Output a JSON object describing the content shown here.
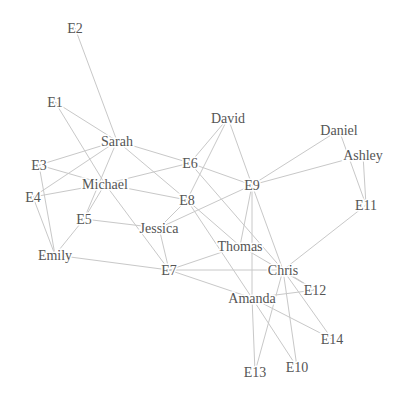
{
  "diagram": {
    "type": "network-graph",
    "background": "#ffffff",
    "edge_color": "#c8c8c8",
    "label_color": "#555555",
    "nodes": [
      {
        "id": "E2",
        "label": "E2",
        "x": 75,
        "y": 28
      },
      {
        "id": "E1",
        "label": "E1",
        "x": 55,
        "y": 102
      },
      {
        "id": "Sarah",
        "label": "Sarah",
        "x": 117,
        "y": 141
      },
      {
        "id": "E3",
        "label": "E3",
        "x": 39,
        "y": 165
      },
      {
        "id": "Michael",
        "label": "Michael",
        "x": 105,
        "y": 184
      },
      {
        "id": "E4",
        "label": "E4",
        "x": 33,
        "y": 197
      },
      {
        "id": "E5",
        "label": "E5",
        "x": 84,
        "y": 219
      },
      {
        "id": "Emily",
        "label": "Emily",
        "x": 55,
        "y": 255
      },
      {
        "id": "Jessica",
        "label": "Jessica",
        "x": 159,
        "y": 228
      },
      {
        "id": "E8",
        "label": "E8",
        "x": 187,
        "y": 200
      },
      {
        "id": "E6",
        "label": "E6",
        "x": 190,
        "y": 163
      },
      {
        "id": "David",
        "label": "David",
        "x": 228,
        "y": 118
      },
      {
        "id": "E9",
        "label": "E9",
        "x": 252,
        "y": 185
      },
      {
        "id": "Daniel",
        "label": "Daniel",
        "x": 339,
        "y": 130
      },
      {
        "id": "Ashley",
        "label": "Ashley",
        "x": 363,
        "y": 155
      },
      {
        "id": "E11",
        "label": "E11",
        "x": 366,
        "y": 205
      },
      {
        "id": "Thomas",
        "label": "Thomas",
        "x": 240,
        "y": 246
      },
      {
        "id": "Chris",
        "label": "Chris",
        "x": 283,
        "y": 270
      },
      {
        "id": "E7",
        "label": "E7",
        "x": 169,
        "y": 270
      },
      {
        "id": "E12",
        "label": "E12",
        "x": 315,
        "y": 290
      },
      {
        "id": "Amanda",
        "label": "Amanda",
        "x": 252,
        "y": 298
      },
      {
        "id": "E14",
        "label": "E14",
        "x": 332,
        "y": 339
      },
      {
        "id": "E13",
        "label": "E13",
        "x": 255,
        "y": 372
      },
      {
        "id": "E10",
        "label": "E10",
        "x": 297,
        "y": 367
      }
    ],
    "edges": [
      [
        "E2",
        "Sarah"
      ],
      [
        "E1",
        "Sarah"
      ],
      [
        "E1",
        "Michael"
      ],
      [
        "Sarah",
        "E3"
      ],
      [
        "Sarah",
        "E4"
      ],
      [
        "Sarah",
        "E5"
      ],
      [
        "Sarah",
        "E6"
      ],
      [
        "Sarah",
        "E8"
      ],
      [
        "E3",
        "Michael"
      ],
      [
        "E3",
        "Emily"
      ],
      [
        "Michael",
        "E4"
      ],
      [
        "Michael",
        "E6"
      ],
      [
        "Michael",
        "E8"
      ],
      [
        "Michael",
        "E5"
      ],
      [
        "Michael",
        "E7"
      ],
      [
        "E4",
        "Emily"
      ],
      [
        "E5",
        "Emily"
      ],
      [
        "E5",
        "Jessica"
      ],
      [
        "Emily",
        "E7"
      ],
      [
        "Jessica",
        "E8"
      ],
      [
        "Jessica",
        "E7"
      ],
      [
        "Jessica",
        "E9"
      ],
      [
        "E8",
        "David"
      ],
      [
        "E8",
        "Thomas"
      ],
      [
        "E8",
        "Amanda"
      ],
      [
        "E6",
        "David"
      ],
      [
        "E6",
        "E9"
      ],
      [
        "E6",
        "Chris"
      ],
      [
        "David",
        "E9"
      ],
      [
        "E9",
        "Daniel"
      ],
      [
        "E9",
        "Ashley"
      ],
      [
        "E9",
        "Thomas"
      ],
      [
        "E9",
        "Chris"
      ],
      [
        "E9",
        "Amanda"
      ],
      [
        "Daniel",
        "E11"
      ],
      [
        "Ashley",
        "E11"
      ],
      [
        "E11",
        "Chris"
      ],
      [
        "Thomas",
        "E7"
      ],
      [
        "Thomas",
        "E12"
      ],
      [
        "E7",
        "Chris"
      ],
      [
        "E7",
        "Amanda"
      ],
      [
        "Chris",
        "E12"
      ],
      [
        "Chris",
        "E14"
      ],
      [
        "Chris",
        "E13"
      ],
      [
        "Chris",
        "E10"
      ],
      [
        "Amanda",
        "E12"
      ],
      [
        "Amanda",
        "E14"
      ],
      [
        "Amanda",
        "E13"
      ],
      [
        "Amanda",
        "E10"
      ]
    ]
  }
}
